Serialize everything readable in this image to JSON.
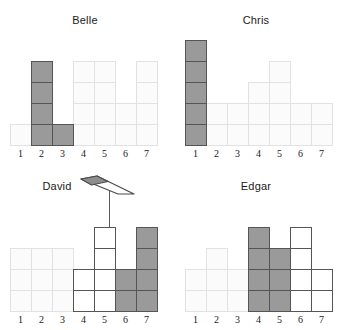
{
  "page": {
    "background_color": "#ffffff",
    "width": 341,
    "height": 330
  },
  "colors": {
    "dark_fill": "#9a9a9a",
    "dark_stroke": "#555555",
    "light_fill": "#fbfbfb",
    "light_stroke": "#e2e2e2",
    "white_fill": "#ffffff",
    "text": "#1a1a1a",
    "cursor": "#5a5a5a"
  },
  "cursor": {
    "name": "stylus-pointer-cursor",
    "x": 78,
    "y": 175,
    "stem_x": 109,
    "stem_top": 190,
    "stem_bottom": 300
  },
  "chart_data": [
    {
      "type": "bar",
      "title": "Belle",
      "xlabel": "",
      "ylabel": "",
      "categories": [
        "1",
        "2",
        "3",
        "4",
        "5",
        "6",
        "7"
      ],
      "values": [
        1,
        4,
        1,
        4,
        4,
        2,
        4
      ],
      "states": [
        "light",
        "dark",
        "dark",
        "light",
        "light",
        "light",
        "light"
      ],
      "ylim": [
        0,
        4
      ],
      "grid": true,
      "legend": "none"
    },
    {
      "type": "bar",
      "title": "Chris",
      "xlabel": "",
      "ylabel": "",
      "categories": [
        "1",
        "2",
        "3",
        "4",
        "5",
        "6",
        "7"
      ],
      "values": [
        5,
        2,
        2,
        3,
        4,
        2,
        2
      ],
      "states": [
        "dark",
        "light",
        "light",
        "light",
        "light",
        "light",
        "light"
      ],
      "ylim": [
        0,
        5
      ],
      "grid": true,
      "legend": "none"
    },
    {
      "type": "bar",
      "title": "David",
      "xlabel": "",
      "ylabel": "",
      "categories": [
        "1",
        "2",
        "3",
        "4",
        "5",
        "6",
        "7"
      ],
      "values": [
        3,
        3,
        3,
        2,
        4,
        2,
        4
      ],
      "states": [
        "light",
        "light",
        "light",
        "white",
        "white",
        "dark",
        "dark"
      ],
      "ylim": [
        0,
        4
      ],
      "grid": true,
      "legend": "none"
    },
    {
      "type": "bar",
      "title": "Edgar",
      "xlabel": "",
      "ylabel": "",
      "categories": [
        "1",
        "2",
        "3",
        "4",
        "5",
        "6",
        "7"
      ],
      "values": [
        2,
        3,
        2,
        4,
        3,
        4,
        2
      ],
      "states": [
        "light",
        "light",
        "light",
        "dark",
        "dark",
        "white",
        "white"
      ],
      "ylim": [
        0,
        4
      ],
      "grid": true,
      "legend": "none"
    }
  ],
  "panels": {
    "belle": {
      "title": "Belle",
      "axis": [
        "1",
        "2",
        "3",
        "4",
        "5",
        "6",
        "7"
      ]
    },
    "chris": {
      "title": "Chris",
      "axis": [
        "1",
        "2",
        "3",
        "4",
        "5",
        "6",
        "7"
      ]
    },
    "david": {
      "title": "David",
      "axis": [
        "1",
        "2",
        "3",
        "4",
        "5",
        "6",
        "7"
      ]
    },
    "edgar": {
      "title": "Edgar",
      "axis": [
        "1",
        "2",
        "3",
        "4",
        "5",
        "6",
        "7"
      ]
    }
  }
}
